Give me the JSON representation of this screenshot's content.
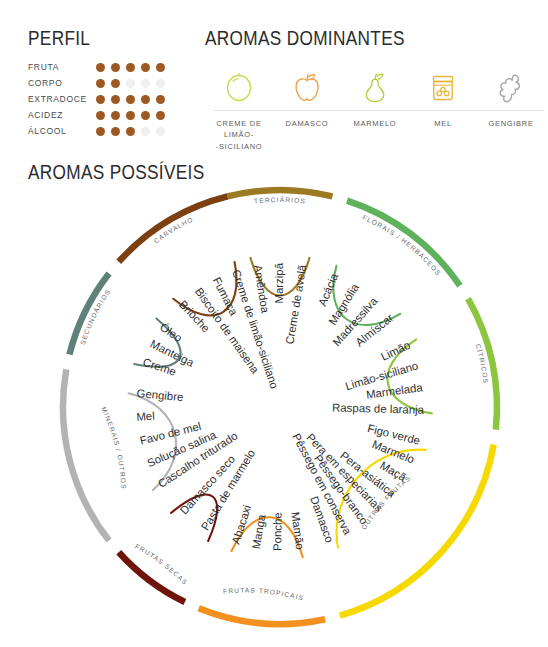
{
  "perfil": {
    "title": "PERFIL",
    "max": 5,
    "rows": [
      {
        "label": "FRUTA",
        "value": 5
      },
      {
        "label": "CORPO",
        "value": 2
      },
      {
        "label": "EXTRADOCE",
        "value": 5
      },
      {
        "label": "ACIDEZ",
        "value": 5
      },
      {
        "label": "ÁLCOOL",
        "value": 3
      }
    ],
    "filled_color": "#9e5922",
    "empty_color": "#f0eeee"
  },
  "dominantes": {
    "title": "AROMAS DOMINANTES",
    "items": [
      {
        "label": "CREME DE\nLIMÃO-\n-SICILIANO",
        "icon": "lemon-icon",
        "color": "#c8d94a"
      },
      {
        "label": "DAMASCO",
        "icon": "apricot-icon",
        "color": "#eda04a"
      },
      {
        "label": "MARMELO",
        "icon": "pear-icon",
        "color": "#b4cf3e"
      },
      {
        "label": "MEL",
        "icon": "honey-jar-icon",
        "color": "#e8b63c"
      },
      {
        "label": "GENGIBRE",
        "icon": "ginger-root-icon",
        "color": "#a8a8a8"
      }
    ]
  },
  "wheel": {
    "title": "AROMAS POSSÍVEIS",
    "groups": [
      {
        "name": "TERCIÁRIOS",
        "color": "#9b7a23",
        "items": [
          "Amêndoa",
          "Marzipã",
          "Creme de avelã"
        ]
      },
      {
        "name": "FLORAIS / HERBÁCEOS",
        "color": "#5fb15c",
        "items": [
          "Acácia",
          "Magnólia",
          "Madressilva",
          "Almíscar"
        ]
      },
      {
        "name": "CÍTRICOS",
        "color": "#8cc63f",
        "items": [
          "Limão",
          "Limão-siciliano",
          "Marmelada",
          "Raspas de laranja"
        ]
      },
      {
        "name": "OUTRAS FRUTAS",
        "color": "#f5d900",
        "items": [
          "Figo verde",
          "Marmelo",
          "Maçã",
          "Pera-asiática",
          "Pera em especiarias",
          "Pêssego-branco",
          "Pêssego em conserva",
          "Damasco"
        ]
      },
      {
        "name": "FRUTAS TROPICAIS",
        "color": "#f29120",
        "items": [
          "Mamão",
          "Ponche",
          "Manga",
          "Abacaxi"
        ]
      },
      {
        "name": "FRUTAS SECAS",
        "color": "#6e1408",
        "items": [
          "Pasta de marmelo",
          "Damasco seco"
        ]
      },
      {
        "name": "MINERAIS / OUTROS",
        "color": "#b3b3b3",
        "items": [
          "Cascalho triturado",
          "Solução salina",
          "Favo de mel",
          "Mel",
          "Gengibre"
        ]
      },
      {
        "name": "SECUNDÁRIOS",
        "color": "#5f8179",
        "items": [
          "Creme",
          "Manteiga",
          "Óleo"
        ]
      },
      {
        "name": "CARVALHO",
        "color": "#7b3f10",
        "items": [
          "Brioche",
          "Biscoito de maisena",
          "Fumaça",
          "Creme de limão-siciliano"
        ]
      }
    ]
  }
}
